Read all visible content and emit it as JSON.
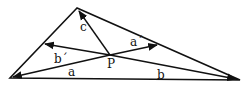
{
  "diagram": {
    "type": "triangle-with-interior-point-vectors",
    "colors": {
      "stroke": "#111111",
      "background": "#ffffff"
    },
    "vertices": {
      "top": [
        77,
        8
      ],
      "left": [
        10,
        78
      ],
      "right": [
        240,
        80
      ]
    },
    "point": {
      "label": "P",
      "pos": [
        110,
        55
      ]
    },
    "vectors": [
      {
        "name": "a",
        "label": "a",
        "from": [
          110,
          55
        ],
        "to": [
          13,
          77
        ],
        "label_pos": [
          68,
          76
        ]
      },
      {
        "name": "b",
        "label": "b",
        "from": [
          110,
          55
        ],
        "to": [
          236,
          79
        ],
        "label_pos": [
          157,
          79
        ]
      },
      {
        "name": "c",
        "label": "c",
        "from": [
          110,
          55
        ],
        "to": [
          79,
          11
        ],
        "label_pos": [
          80,
          31
        ]
      },
      {
        "name": "a-prime",
        "label": "a´",
        "from": [
          110,
          55
        ],
        "to": [
          157,
          45
        ],
        "label_pos": [
          130,
          46
        ]
      },
      {
        "name": "b-prime",
        "label": "b´",
        "from": [
          110,
          55
        ],
        "to": [
          45,
          44
        ],
        "label_pos": [
          54,
          63
        ]
      }
    ]
  }
}
